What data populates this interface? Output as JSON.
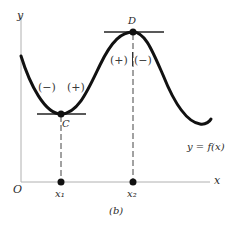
{
  "figure": {
    "caption": "(b)",
    "axes": {
      "x_label": "x",
      "y_label": "y",
      "origin_label": "O"
    },
    "curve_label": "y = f(x)",
    "points": [
      {
        "name": "C",
        "type": "local minimum",
        "x_label": "x₁"
      },
      {
        "name": "D",
        "type": "local maximum",
        "x_label": "x₂"
      }
    ],
    "sign_labels": {
      "left_of_C": "(−)",
      "right_of_C": "(+)",
      "left_of_D": "(+)",
      "right_of_D": "(−)"
    },
    "colors": {
      "curve": "#111111",
      "axis": "#aaaaaa",
      "text": "#2a2a2a"
    }
  }
}
